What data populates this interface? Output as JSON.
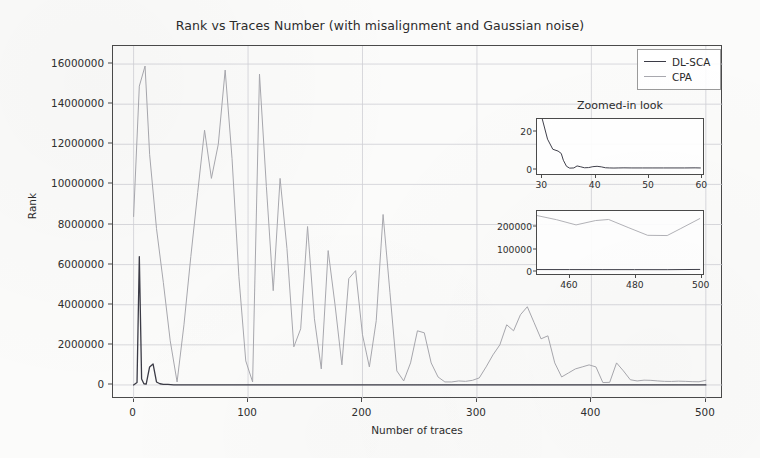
{
  "chart_data": {
    "type": "line",
    "title": "Rank vs Traces Number (with misalignment and Gaussian noise)",
    "xlabel": "Number of traces",
    "ylabel": "Rank",
    "xlim": [
      -18,
      515
    ],
    "ylim": [
      -700000,
      16900000
    ],
    "xticks": [
      0,
      100,
      200,
      300,
      400,
      500
    ],
    "yticks": [
      0,
      2000000,
      4000000,
      6000000,
      8000000,
      10000000,
      12000000,
      14000000,
      16000000
    ],
    "ytick_labels": [
      "0",
      "2000000",
      "4000000",
      "6000000",
      "8000000",
      "10000000",
      "12000000",
      "14000000",
      "16000000"
    ],
    "xtick_labels": [
      "0",
      "100",
      "200",
      "300",
      "400",
      "500"
    ],
    "grid": true,
    "legend_position": "upper right",
    "colors": {
      "dl_sca": "#3b3b46",
      "cpa": "#a8a8ae",
      "axis": "#4a4a4a",
      "grid": "#cfcfd4",
      "background": "#fbfbfa",
      "text": "#2c2c2c"
    },
    "series": [
      {
        "name": "DL-SCA",
        "color": "#3b3b46",
        "x": [
          0,
          3,
          5,
          7,
          9,
          11,
          14,
          17,
          20,
          23,
          26,
          30,
          35,
          40,
          50,
          60,
          80,
          100,
          130,
          160,
          200,
          250,
          300,
          350,
          400,
          450,
          470,
          500
        ],
        "y": [
          0,
          120000,
          6400000,
          300000,
          60000,
          40000,
          900000,
          1050000,
          150000,
          60000,
          30000,
          25000,
          8000,
          6000,
          5000,
          4000,
          3500,
          3000,
          2500,
          2000,
          1800,
          1500,
          1400,
          1200,
          1000,
          900,
          850,
          800
        ]
      },
      {
        "name": "CPA",
        "color": "#a8a8ae",
        "x": [
          0,
          5,
          10,
          14,
          20,
          26,
          32,
          38,
          44,
          50,
          56,
          62,
          68,
          74,
          80,
          86,
          92,
          98,
          104,
          110,
          116,
          122,
          128,
          134,
          140,
          146,
          152,
          158,
          164,
          170,
          176,
          182,
          188,
          194,
          200,
          206,
          212,
          218,
          224,
          230,
          236,
          242,
          248,
          254,
          260,
          266,
          272,
          278,
          284,
          290,
          296,
          302,
          308,
          314,
          320,
          326,
          332,
          338,
          344,
          350,
          356,
          362,
          368,
          374,
          380,
          386,
          392,
          398,
          404,
          410,
          416,
          422,
          428,
          434,
          440,
          446,
          452,
          458,
          464,
          470,
          476,
          482,
          488,
          494,
          500
        ],
        "y": [
          8400000,
          14900000,
          15900000,
          11500000,
          7800000,
          5100000,
          2200000,
          150000,
          3000000,
          6400000,
          9600000,
          12700000,
          10300000,
          12000000,
          15700000,
          11300000,
          5400000,
          1200000,
          150000,
          15500000,
          9900000,
          4700000,
          10300000,
          6800000,
          1900000,
          2800000,
          7900000,
          3300000,
          800000,
          6700000,
          4000000,
          1000000,
          5300000,
          5700000,
          2500000,
          900000,
          3200000,
          8500000,
          4600000,
          700000,
          200000,
          1100000,
          2700000,
          2600000,
          1100000,
          400000,
          150000,
          150000,
          200000,
          180000,
          230000,
          350000,
          900000,
          1500000,
          2000000,
          3000000,
          2700000,
          3500000,
          3900000,
          3100000,
          2300000,
          2450000,
          1100000,
          400000,
          600000,
          800000,
          900000,
          1000000,
          900000,
          120000,
          130000,
          1100000,
          700000,
          260000,
          200000,
          240000,
          230000,
          200000,
          180000,
          175000,
          190000,
          180000,
          165000,
          160000,
          230000
        ]
      }
    ],
    "insets": [
      {
        "id": "inset1",
        "title": "Zoomed-in look",
        "xlim": [
          29,
          60.5
        ],
        "ylim": [
          -3,
          27
        ],
        "xticks": [
          30,
          40,
          50,
          60
        ],
        "yticks": [
          0,
          20
        ],
        "xtick_labels": [
          "30",
          "40",
          "50",
          "60"
        ],
        "ytick_labels": [
          "0",
          "20"
        ],
        "series": [
          {
            "name": "DL-SCA",
            "color": "#3b3b46",
            "x": [
              30,
              31,
              32,
              33,
              33.6,
              34,
              34.6,
              35.2,
              36,
              36.6,
              37.2,
              38,
              38.8,
              39.6,
              40.4,
              41.2,
              42,
              42.8,
              43.6,
              44.4,
              45.5,
              47,
              49,
              51,
              53,
              55,
              57,
              59,
              60
            ],
            "y": [
              27,
              16,
              10.5,
              9.5,
              8.2,
              4.5,
              1.2,
              0.2,
              0.3,
              1.4,
              1.0,
              0.4,
              0.5,
              1.0,
              1.2,
              0.9,
              0.4,
              0.3,
              0.25,
              0.3,
              0.35,
              0.3,
              0.3,
              0.3,
              0.3,
              0.3,
              0.3,
              0.35,
              0.3
            ]
          }
        ]
      },
      {
        "id": "inset2",
        "xlim": [
          450,
          501
        ],
        "ylim": [
          -18000,
          272000
        ],
        "xticks": [
          460,
          480,
          500
        ],
        "yticks": [
          0,
          100000,
          200000
        ],
        "xtick_labels": [
          "460",
          "480",
          "500"
        ],
        "ytick_labels": [
          "0",
          "100000",
          "200000"
        ],
        "series": [
          {
            "name": "CPA",
            "color": "#a8a8ae",
            "x": [
              450,
              456,
              462,
              468,
              472,
              478,
              484,
              490,
              494,
              500
            ],
            "y": [
              251000,
              232000,
              208000,
              228000,
              233000,
              196000,
              160000,
              159000,
              190000,
              237000
            ]
          },
          {
            "name": "DL-SCA",
            "color": "#3b3b46",
            "x": [
              450,
              460,
              470,
              480,
              490,
              500
            ],
            "y": [
              2500,
              2300,
              2200,
              2100,
              2000,
              3000
            ]
          }
        ]
      }
    ]
  },
  "legend": {
    "entries": [
      {
        "label": "DL-SCA",
        "color": "#3b3b46"
      },
      {
        "label": "CPA",
        "color": "#a8a8ae"
      }
    ]
  }
}
